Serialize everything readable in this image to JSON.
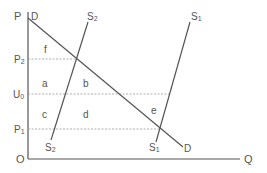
{
  "diagram": {
    "axes": {
      "y_label": "P",
      "x_label": "Q",
      "origin": "O"
    },
    "price_levels": [
      {
        "label": "P2",
        "main": "P",
        "sub": "2"
      },
      {
        "label": "U0",
        "main": "U",
        "sub": "0"
      },
      {
        "label": "P1",
        "main": "P",
        "sub": "1"
      }
    ],
    "curves": {
      "demand": {
        "label_top": "D",
        "label_bottom": "D"
      },
      "supply_2": {
        "top_main": "S",
        "top_sub": "2",
        "bottom_main": "S",
        "bottom_sub": "2"
      },
      "supply_1": {
        "top_main": "S",
        "top_sub": "1",
        "bottom_main": "S",
        "bottom_sub": "1"
      }
    },
    "regions": {
      "f": "f",
      "a": "a",
      "b": "b",
      "c": "c",
      "d": "d",
      "e": "e"
    },
    "colors": {
      "line": "#555555",
      "dashed": "#999999",
      "text": "#555555"
    }
  }
}
